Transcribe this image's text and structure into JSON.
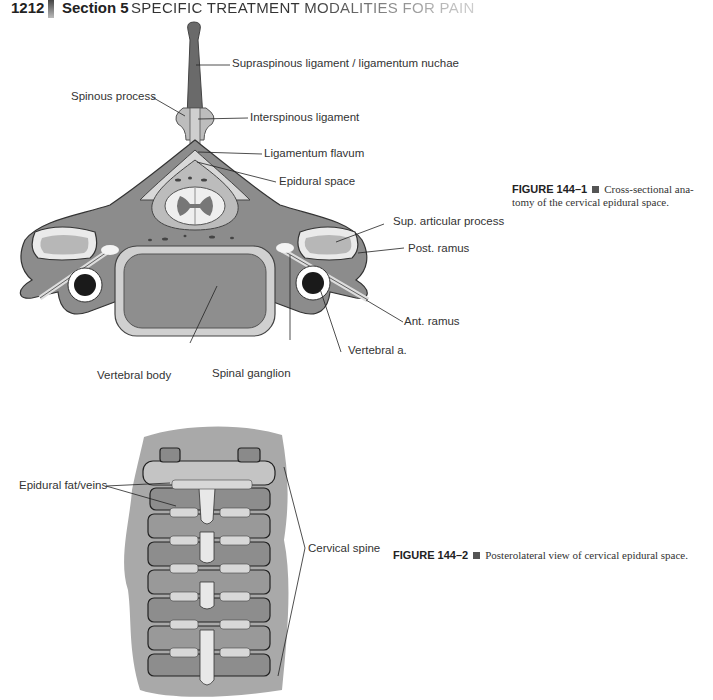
{
  "header": {
    "page_number": "1212",
    "section": "Section 5",
    "section_title": "SPECIFIC TREATMENT MODALITIES FOR PAIN"
  },
  "figure1": {
    "labels": {
      "supraspinous": "Supraspinous ligament / ligamentum nuchae",
      "spinous_process": "Spinous process",
      "interspinous": "Interspinous ligament",
      "ligamentum_flavum": "Ligamentum flavum",
      "epidural_space": "Epidural space",
      "sup_articular": "Sup. articular process",
      "post_ramus": "Post. ramus",
      "ant_ramus": "Ant. ramus",
      "vertebral_a": "Vertebral a.",
      "vertebral_body": "Vertebral body",
      "spinal_ganglion": "Spinal ganglion"
    },
    "caption": {
      "number": "FIGURE 144–1",
      "text_line1": "Cross-sectional ana-",
      "text_line2": "tomy of the cervical epidural space."
    }
  },
  "figure2": {
    "labels": {
      "epidural_fat": "Epidural fat/veins",
      "cervical_spine": "Cervical spine"
    },
    "caption": {
      "number": "FIGURE 144–2",
      "text": "Posterolateral view of cervical epidural space."
    }
  }
}
